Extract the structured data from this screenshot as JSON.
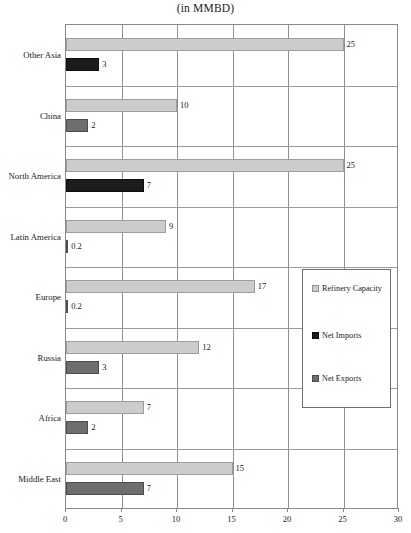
{
  "chart_data": {
    "type": "bar",
    "title": "(in MMBD)",
    "subtitle": "",
    "xlabel": "",
    "ylabel": "",
    "orientation": "horizontal",
    "xlim": [
      0,
      30
    ],
    "xticks": [
      0,
      5,
      10,
      15,
      20,
      25,
      30
    ],
    "xtick_labels": [
      "0",
      "5",
      "10",
      "15",
      "20",
      "25",
      "30"
    ],
    "grid": "vertical",
    "legend_position": "center-right",
    "categories": [
      "Other Asia",
      "China",
      "North America",
      "Latin America",
      "Europe",
      "Russia",
      "Africa",
      "Middle East"
    ],
    "series": [
      {
        "name": "Refinery Capacity",
        "color": "#cccccc",
        "values": [
          25,
          10,
          25,
          9,
          17,
          12,
          7,
          15
        ],
        "labels": [
          "25",
          "10",
          "25",
          "9",
          "17",
          "12",
          "7",
          "15"
        ]
      },
      {
        "name": "Net Imports",
        "color": "#1c1c1c",
        "values": [
          3,
          null,
          7,
          null,
          null,
          null,
          null,
          null
        ],
        "labels": [
          "3",
          "",
          "7",
          "",
          "",
          "",
          "",
          ""
        ]
      },
      {
        "name": "Net Exports",
        "color": "#6e6e6e",
        "values": [
          null,
          2,
          null,
          0.2,
          0.2,
          3,
          2,
          7
        ],
        "labels": [
          "",
          "2",
          "",
          "0.2",
          "0.2",
          "3",
          "2",
          "7"
        ]
      }
    ]
  },
  "legend": {
    "items": [
      {
        "label": "Refinery Capacity",
        "swatch": "capacity"
      },
      {
        "label": "Net Imports",
        "swatch": "imports"
      },
      {
        "label": "Net Exports",
        "swatch": "exports"
      }
    ]
  },
  "colors": {
    "refinery_capacity": "#cccccc",
    "net_imports": "#1c1c1c",
    "net_exports": "#6e6e6e",
    "axis": "#8a8a8a",
    "grid": "#9a9a9a",
    "text": "#1a1a1a",
    "background": "#ffffff"
  }
}
